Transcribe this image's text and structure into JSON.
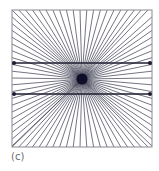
{
  "figure": {
    "box": {
      "x": 12,
      "y": 10,
      "width": 140,
      "height": 137
    },
    "center": {
      "x": 82,
      "y": 79
    },
    "ray_spacing_px": 6.8,
    "ray_color": "#3a3a4e",
    "frame_color": "#8a8a92",
    "parallel_lines": [
      {
        "y": 63,
        "x1": 14,
        "x2": 150
      },
      {
        "y": 94,
        "x1": 14,
        "x2": 150
      }
    ],
    "line_color": "#1c1c30",
    "endpoint_color": "#1c1c30",
    "center_dot_color": "#0e0e28"
  },
  "caption": {
    "label": "(c)"
  }
}
